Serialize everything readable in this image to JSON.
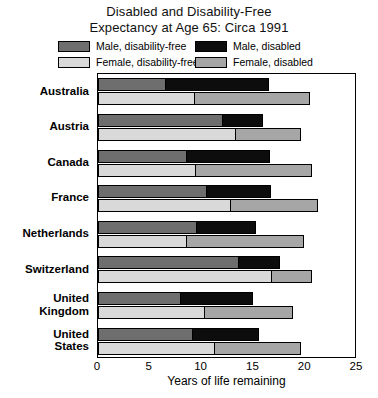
{
  "title": {
    "line1": "Disabled and Disability-Free",
    "line2": "Expectancy at Age 65: Circa 1991"
  },
  "legend": {
    "items": [
      {
        "label": "Male, disability-free",
        "key": "male_free",
        "color": "#6e6e6e"
      },
      {
        "label": "Male, disabled",
        "key": "male_dis",
        "color": "#0d0d0d"
      },
      {
        "label": "Female, disability-free",
        "key": "fem_free",
        "color": "#d9d9d9"
      },
      {
        "label": "Female, disabled",
        "key": "fem_dis",
        "color": "#a6a6a6"
      }
    ]
  },
  "axis": {
    "x_title": "Years of life remaining",
    "x_ticks": [
      "0",
      "5",
      "10",
      "15",
      "20",
      "25"
    ],
    "x_min": 0,
    "x_max": 25
  },
  "chart_data": {
    "type": "bar",
    "orientation": "horizontal",
    "stacked": true,
    "title": "Disabled and Disability-Free Expectancy at Age 65: Circa 1991",
    "xlabel": "Years of life remaining",
    "ylabel": "",
    "xlim": [
      0,
      25
    ],
    "grid": false,
    "legend_position": "top",
    "categories": [
      "Australia",
      "Austria",
      "Canada",
      "France",
      "Netherlands",
      "Switzerland",
      "United Kingdom",
      "United States"
    ],
    "series": [
      {
        "name": "Male, disability-free",
        "color": "#6e6e6e",
        "values": [
          6.6,
          12.1,
          8.6,
          10.5,
          9.6,
          13.6,
          8.0,
          9.2
        ]
      },
      {
        "name": "Male, disabled",
        "color": "#0d0d0d",
        "values": [
          10.0,
          3.9,
          8.1,
          6.3,
          5.7,
          4.1,
          7.1,
          6.4
        ]
      },
      {
        "name": "Female, disability-free",
        "color": "#d9d9d9",
        "values": [
          9.4,
          13.3,
          9.5,
          12.8,
          8.6,
          16.8,
          10.3,
          11.3
        ]
      },
      {
        "name": "Female, disabled",
        "color": "#a6a6a6",
        "values": [
          11.2,
          6.4,
          11.3,
          8.5,
          11.4,
          4.0,
          8.6,
          8.4
        ]
      }
    ],
    "totals": {
      "male": [
        16.6,
        16.0,
        16.7,
        16.8,
        15.3,
        17.7,
        15.1,
        15.6
      ],
      "female": [
        20.6,
        19.7,
        20.8,
        21.3,
        20.0,
        20.8,
        18.9,
        19.7
      ]
    }
  }
}
